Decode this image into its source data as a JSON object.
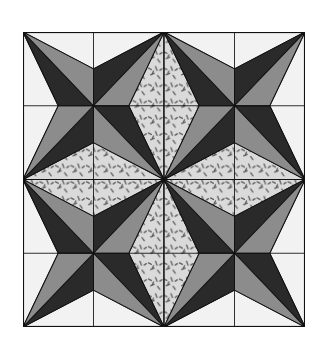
{
  "figure": {
    "grid": {
      "rows": 4,
      "cols": 4
    },
    "colors": {
      "background": "#ffffff",
      "light": "#f2f2f2",
      "dark": "#2a2a2a",
      "medium": "#8c8c8c",
      "print_base": "#dadada",
      "print_mark": "#5a5a5a",
      "line": "#111111"
    },
    "quadrants": [
      {
        "name": "top-left",
        "patterned_sides": [
          "right",
          "bottom"
        ]
      },
      {
        "name": "top-right",
        "patterned_sides": [
          "left",
          "bottom"
        ]
      },
      {
        "name": "bottom-left",
        "patterned_sides": [
          "top",
          "right"
        ]
      },
      {
        "name": "bottom-right",
        "patterned_sides": [
          "top",
          "left"
        ]
      }
    ]
  }
}
